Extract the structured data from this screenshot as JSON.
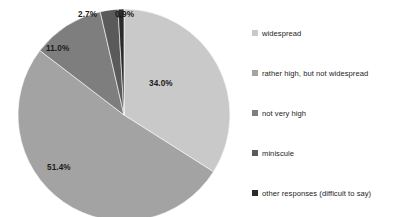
{
  "chart_data": {
    "type": "pie",
    "title": "",
    "categories": [
      "widespread",
      "rather high, but not widespread",
      "not very high",
      "miniscule",
      "other responses (difficult to say)"
    ],
    "values": [
      34.0,
      51.4,
      11.0,
      2.7,
      0.9
    ],
    "data_labels": [
      "34.0%",
      "51.4%",
      "11.0%",
      "2.7%",
      "0.9%"
    ],
    "colors": [
      "#c9c9c9",
      "#a3a3a3",
      "#7e7e7e",
      "#5a5a5a",
      "#2b2b2b"
    ],
    "units": "percent",
    "start_angle_deg": 0,
    "direction": "clockwise",
    "legend_position": "right",
    "grid": false,
    "xlabel": "",
    "ylabel": ""
  },
  "labels": {
    "widespread": "34.0%",
    "rather_high": "51.4%",
    "not_very_high": "11.0%",
    "miniscule": "2.7%",
    "other": "0.9%"
  },
  "legend": {
    "items": [
      {
        "label": "widespread",
        "color": "#c9c9c9"
      },
      {
        "label": "rather high, but not widespread",
        "color": "#a3a3a3"
      },
      {
        "label": "not very high",
        "color": "#7e7e7e"
      },
      {
        "label": "miniscule",
        "color": "#5a5a5a"
      },
      {
        "label": "other responses (difficult to say)",
        "color": "#2b2b2b"
      }
    ]
  }
}
